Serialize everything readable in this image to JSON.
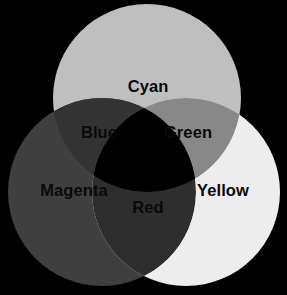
{
  "diagram": {
    "type": "venn-3-circle",
    "canvas": {
      "width": 287,
      "height": 295
    },
    "background_color": "#000000",
    "label_color": "#0a0a0a",
    "circles": [
      {
        "id": "cyan-circle",
        "label": "Cyan",
        "color": "#bfbfbf",
        "cx": 147,
        "cy": 98,
        "r": 94,
        "label_x": 148,
        "label_y": 88
      },
      {
        "id": "magenta-circle",
        "label": "Magenta",
        "color": "#3f3f3f",
        "cx": 102,
        "cy": 192,
        "r": 94,
        "label_x": 74,
        "label_y": 192
      },
      {
        "id": "yellow-circle",
        "label": "Yellow",
        "color": "#ededed",
        "cx": 186,
        "cy": 192,
        "r": 94,
        "label_x": 223,
        "label_y": 192
      }
    ],
    "intersections": [
      {
        "id": "blue-region",
        "label": "Blue",
        "color": "#333333",
        "of": "cyan-circle + magenta-circle",
        "label_x": 99,
        "label_y": 134
      },
      {
        "id": "green-region",
        "label": "Green",
        "color": "#888888",
        "of": "cyan-circle + yellow-circle",
        "label_x": 188,
        "label_y": 134
      },
      {
        "id": "red-region",
        "label": "Red",
        "color": "#2e2e2e",
        "of": "magenta-circle + yellow-circle",
        "label_x": 148,
        "label_y": 209
      },
      {
        "id": "center-region",
        "label": "",
        "color": "#000000",
        "of": "cyan-circle + magenta-circle + yellow-circle",
        "label_x": 145,
        "label_y": 165
      }
    ]
  }
}
